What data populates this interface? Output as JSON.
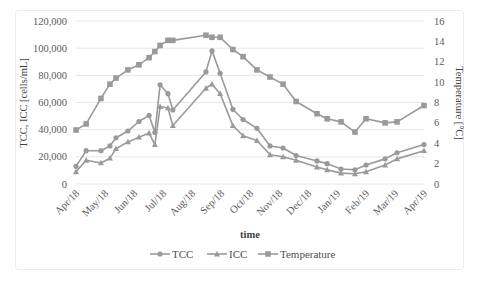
{
  "chart_data": {
    "type": "line",
    "title": "",
    "xlabel": "time",
    "ylabel": "TCC, ICC [cells/mL]",
    "y2label": "Temperature [°C]",
    "ylim": [
      0,
      120000
    ],
    "y2lim": [
      0,
      16
    ],
    "yticks": [
      "0",
      "20,000",
      "40,000",
      "60,000",
      "80,000",
      "100,000",
      "120,000"
    ],
    "y2ticks": [
      "0",
      "2",
      "4",
      "6",
      "8",
      "10",
      "12",
      "14",
      "16"
    ],
    "xticks": [
      "Apr/18",
      "May/18",
      "Jun/18",
      "Jul/18",
      "Aug/18",
      "Sep/18",
      "Oct/18",
      "Nov/18",
      "Dec/18",
      "Jan/19",
      "Feb/19",
      "Mar/19",
      "Apr/19"
    ],
    "grid": "horizontal",
    "legend_position": "bottom",
    "x_months": [
      0,
      0.35,
      0.86,
      1.17,
      1.38,
      1.79,
      2.17,
      2.52,
      2.72,
      2.9,
      3.17,
      3.34,
      4.48,
      4.69,
      4.97,
      5.41,
      5.76,
      6.24,
      6.69,
      7.14,
      7.59,
      8.31,
      8.66,
      9.14,
      9.62,
      10.0,
      10.66,
      11.07,
      12.0
    ],
    "series": [
      {
        "name": "TCC",
        "marker": "circle",
        "axis": "left",
        "values": [
          13000,
          24500,
          24500,
          28000,
          34000,
          39000,
          46000,
          50500,
          38000,
          73000,
          66500,
          54500,
          82500,
          98000,
          81500,
          55000,
          47500,
          41000,
          28000,
          26500,
          21000,
          17000,
          15000,
          11000,
          10500,
          14000,
          18500,
          23000,
          29000
        ]
      },
      {
        "name": "ICC",
        "marker": "triangle",
        "axis": "left",
        "values": [
          9000,
          17500,
          15500,
          19000,
          26000,
          31000,
          34500,
          37500,
          29000,
          57000,
          56000,
          43000,
          70500,
          73500,
          66500,
          43000,
          35500,
          32000,
          21500,
          20000,
          17500,
          12500,
          10500,
          8000,
          7500,
          9000,
          14000,
          18500,
          24500
        ]
      },
      {
        "name": "Temperature",
        "marker": "square",
        "axis": "right",
        "values": [
          5.3,
          5.9,
          8.4,
          9.8,
          10.4,
          11.2,
          11.7,
          12.4,
          13.0,
          13.6,
          14.1,
          14.1,
          14.6,
          14.4,
          14.4,
          13.2,
          12.5,
          11.2,
          10.5,
          9.8,
          8.1,
          6.9,
          6.4,
          6.1,
          5.1,
          6.4,
          6.0,
          6.1,
          7.7
        ]
      }
    ]
  },
  "colors": {
    "line": "#9a9a9a",
    "grid": "#e6e6e6",
    "text": "#595959"
  },
  "legend": {
    "items": [
      "TCC",
      "ICC",
      "Temperature"
    ]
  }
}
